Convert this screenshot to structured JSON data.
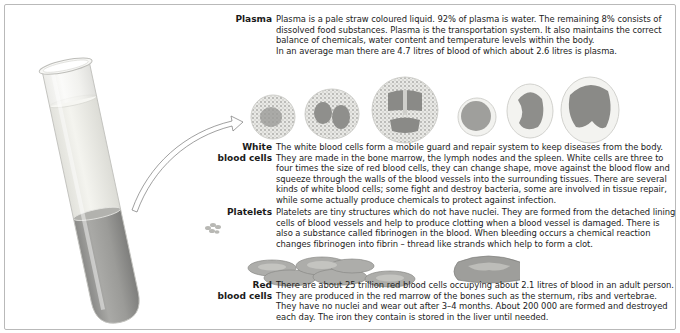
{
  "sections": {
    "plasma": {
      "label": "Plasma",
      "text": "Plasma is a pale straw coloured liquid. 92% of plasma is water. The remaining 8% consists of dissolved food substances. Plasma is the transportation system. It also maintains the correct balance of chemicals, water content and temperature levels within the body.",
      "text2": "In an average man there are 4.7 litres of blood of which about 2.6 litres is plasma."
    },
    "white_blood_cells": {
      "label_line1": "White",
      "label_line2": "blood cells",
      "text": "The white blood cells form a mobile guard and repair system to keep diseases from the body. They are made in the bone marrow, the lymph nodes and the spleen. White cells are three to four times the size of red blood cells, they can change shape, move against the blood flow and squeeze through the walls of the blood vessels into the surrounding tissues. There are several kinds of white blood cells; some fight and destroy bacteria, some are involved in tissue repair, while some actually produce chemicals to protect against infection."
    },
    "platelets": {
      "label": "Platelets",
      "text": "Platelets are tiny structures which do not have nuclei. They are formed from the detached lining cells of blood vessels and help to produce clotting when a blood vessel is damaged. There is also a substance called fibrinogen in the blood. When bleeding occurs a chemical reaction changes fibrinogen into fibrin – thread like strands which help to form a clot."
    },
    "red_blood_cells": {
      "label_line1": "Red",
      "label_line2": "blood cells",
      "text": "There are about 25 trillion red blood cells occupying about 2.1 litres of blood in an adult person. They are produced in the red marrow of the bones such as the sternum, ribs and vertebrae. They have no nuclei and wear out after 3–4 months. About 200 000 are formed and destroyed each day. The iron they contain is stored in the liver until needed."
    }
  },
  "illustrations": {
    "test_tube": "test-tube-separated-blood",
    "white_cells_count": 6,
    "red_cells": "red-blood-cell-stack-and-cross-section",
    "colors": {
      "plasma": "#eeeee6",
      "sediment": "#9a9a98",
      "cell_nucleus": "#8e8e8e"
    }
  }
}
